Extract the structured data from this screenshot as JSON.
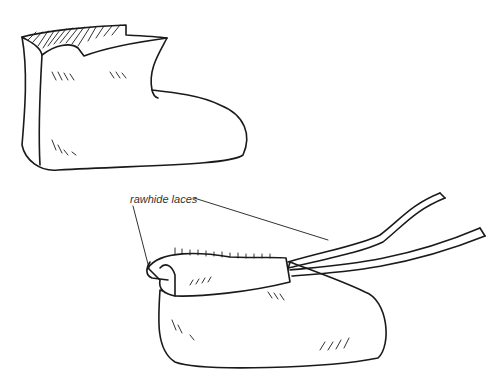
{
  "figure": {
    "illustrations": [
      {
        "name": "moccasin-boot-top",
        "description": "high-top moccasin without laces"
      },
      {
        "name": "moccasin-boot-laced",
        "description": "moccasin with folded cuff and rawhide laces"
      }
    ],
    "annotations": [
      {
        "label": "rawhide laces"
      }
    ]
  }
}
